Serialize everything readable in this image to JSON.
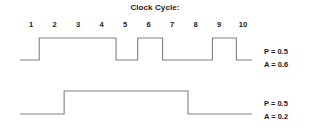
{
  "chart_data": {
    "type": "line",
    "title": "Clock Cycle:",
    "xlabel": "Clock Cycle",
    "ylabel": "",
    "grid": false,
    "legend": "right",
    "categories": [
      "1",
      "2",
      "3",
      "4",
      "5",
      "6",
      "7",
      "8",
      "9",
      "10"
    ],
    "x": [
      1,
      2,
      3,
      4,
      5,
      6,
      7,
      8,
      9,
      10
    ],
    "xlim": [
      0.5,
      10.5
    ],
    "ylim": [
      0,
      1
    ],
    "series": [
      {
        "name": "P = 0.5 / A = 0.6",
        "description": "Upper digital waveform, high during cycles 1.4-4.6, 5.4-6.4, 8.4-9.4",
        "values": [
          0,
          1,
          1,
          1,
          0,
          1,
          0,
          0,
          1,
          0
        ],
        "transitions": [
          {
            "cycle": 1.35,
            "level": 1
          },
          {
            "cycle": 4.62,
            "level": 0
          },
          {
            "cycle": 5.54,
            "level": 1
          },
          {
            "cycle": 6.6,
            "level": 0
          },
          {
            "cycle": 8.72,
            "level": 1
          },
          {
            "cycle": 9.74,
            "level": 0
          }
        ]
      },
      {
        "name": "P = 0.5 / A = 0.2",
        "description": "Lower digital waveform, high during cycles 2.4-7.7",
        "values": [
          0,
          0,
          1,
          1,
          1,
          1,
          1,
          0,
          0,
          0
        ],
        "transitions": [
          {
            "cycle": 2.41,
            "level": 1
          },
          {
            "cycle": 7.68,
            "level": 0
          }
        ]
      }
    ],
    "annotations": [
      {
        "target": "signal-1",
        "lines": [
          "P = 0.5",
          "A = 0.6"
        ]
      },
      {
        "target": "signal-2",
        "lines": [
          "P = 0.5",
          "A = 0.2"
        ]
      }
    ]
  },
  "figure": {
    "title": "Clock Cycle:",
    "cycle_labels": [
      "1",
      "2",
      "3",
      "4",
      "5",
      "6",
      "7",
      "8",
      "9",
      "10"
    ],
    "signal_1": {
      "p_label": "P = 0.5",
      "a_label": "A = 0.6"
    },
    "signal_2": {
      "p_label": "P = 0.5",
      "a_label": "A = 0.2"
    },
    "colors": {
      "background": "#ffffff",
      "waveform": "#808080",
      "text": "#1a1a1a"
    }
  }
}
